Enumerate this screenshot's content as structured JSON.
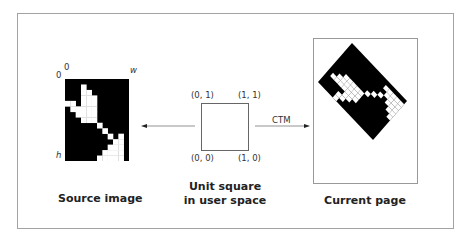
{
  "source_image": {
    "caption": "Source image",
    "axis_labels": {
      "x_origin": "0",
      "y_origin": "0",
      "width": "w",
      "height": "h"
    },
    "grid": {
      "cols": 12,
      "rows": 15
    },
    "white_cells": [
      [
        3,
        1
      ],
      [
        3,
        2
      ],
      [
        4,
        2
      ],
      [
        3,
        3
      ],
      [
        4,
        3
      ],
      [
        5,
        3
      ],
      [
        0,
        4
      ],
      [
        1,
        4
      ],
      [
        3,
        4
      ],
      [
        4,
        4
      ],
      [
        5,
        4
      ],
      [
        1,
        5
      ],
      [
        2,
        5
      ],
      [
        3,
        5
      ],
      [
        4,
        5
      ],
      [
        5,
        5
      ],
      [
        2,
        6
      ],
      [
        3,
        6
      ],
      [
        4,
        6
      ],
      [
        5,
        6
      ],
      [
        3,
        7
      ],
      [
        4,
        7
      ],
      [
        5,
        7
      ],
      [
        6,
        8
      ],
      [
        7,
        9
      ],
      [
        8,
        10
      ],
      [
        10,
        10
      ],
      [
        9,
        11
      ],
      [
        10,
        11
      ],
      [
        8,
        12
      ],
      [
        9,
        12
      ],
      [
        10,
        12
      ],
      [
        7,
        13
      ],
      [
        8,
        13
      ],
      [
        9,
        13
      ],
      [
        10,
        13
      ],
      [
        6,
        14
      ],
      [
        7,
        14
      ],
      [
        8,
        14
      ],
      [
        9,
        14
      ],
      [
        10,
        14
      ]
    ]
  },
  "unit_square": {
    "caption_line1": "Unit square",
    "caption_line2": "in user space",
    "corner_top_left": "(0, 1)",
    "corner_top_right": "(1, 1)",
    "corner_bottom_left": "(0, 0)",
    "corner_bottom_right": "(1, 0)"
  },
  "transform": {
    "label": "CTM"
  },
  "current_page": {
    "caption": "Current page"
  }
}
